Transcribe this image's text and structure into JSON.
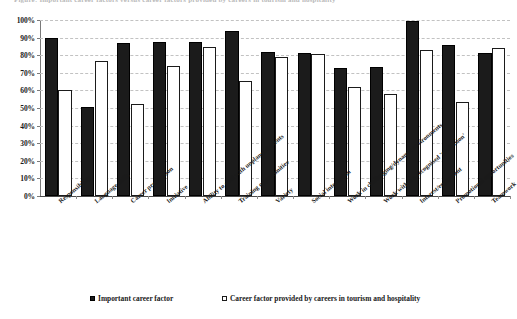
{
  "figure": {
    "clipped_top_caption": "Figure: Important career factors versus career factors provided by careers in tourism and hospitality"
  },
  "legend": {
    "position": "bottom",
    "items": [
      {
        "label": "Important career factor",
        "marker": "filled-square-swatch",
        "color": "#1b1b1b"
      },
      {
        "label": "Career factor provided by careers in tourism and hospitality",
        "marker": "hollow-square-swatch",
        "color": "#ffffff"
      }
    ]
  },
  "chart_data": {
    "type": "bar",
    "title": "",
    "xlabel": "",
    "ylabel": "",
    "ylim": [
      0,
      100
    ],
    "ytick_labels": [
      "0%",
      "10%",
      "20%",
      "30%",
      "40%",
      "50%",
      "60%",
      "70%",
      "80%",
      "90%",
      "100%"
    ],
    "ytick_values": [
      0,
      10,
      20,
      30,
      40,
      50,
      60,
      70,
      80,
      90,
      100
    ],
    "grid": true,
    "legend_position": "bottom",
    "categories": [
      "Responsibility",
      "Language skills",
      "Career progression",
      "Initiative",
      "Ability to deal with unplanned events",
      "Training opportunities",
      "Variety",
      "Social interaction",
      "Work in challenging/dynamic environments",
      "Work within a recognised 'profession'",
      "Interest/enjoyment",
      "Promotional opportunities",
      "Teamwork"
    ],
    "series": [
      {
        "name": "Important career factor",
        "color": "#1b1b1b",
        "values": [
          90,
          50.5,
          87,
          87.5,
          87.5,
          94,
          82,
          81,
          73,
          73.5,
          99.5,
          86,
          81.5
        ]
      },
      {
        "name": "Career factor provided by careers in tourism and hospitality",
        "color": "#ffffff",
        "values": [
          60,
          76.5,
          52.5,
          74,
          84.5,
          65.5,
          79,
          80.5,
          62,
          58,
          83,
          53.5,
          84
        ]
      }
    ]
  }
}
